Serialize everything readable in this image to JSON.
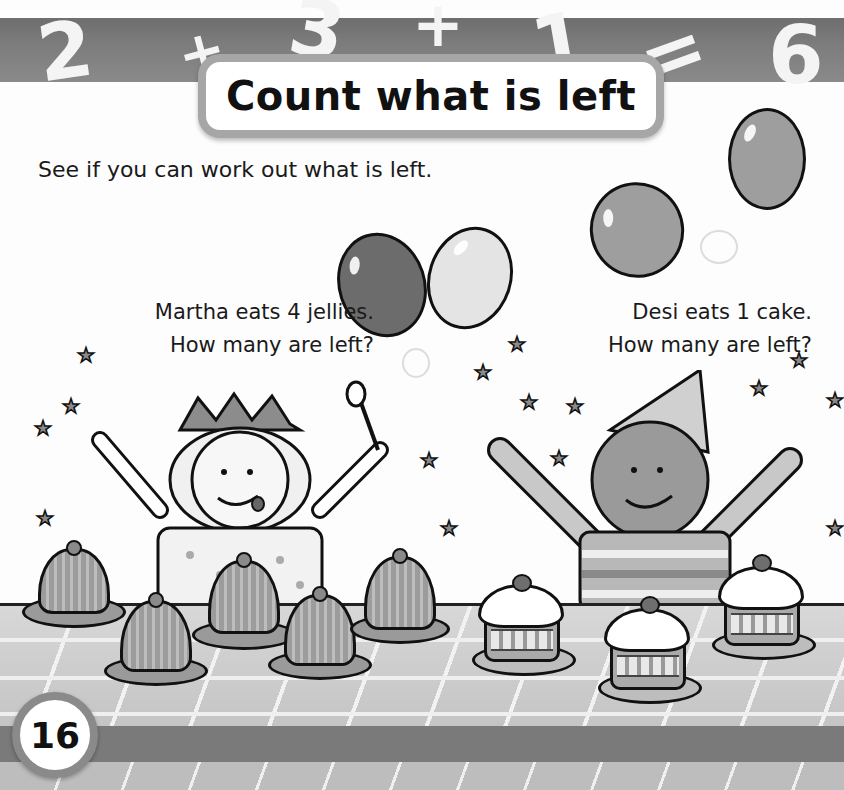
{
  "header": {
    "equation": [
      "2",
      "+",
      "3",
      "+",
      "1",
      "=",
      "6"
    ],
    "title": "Count what is left"
  },
  "intro": "See if you can work out what is left.",
  "scenes": [
    {
      "character": "Martha",
      "line1": "Martha eats 4 jellies.",
      "line2": "How many are left?",
      "food": "jelly",
      "food_count": 6
    },
    {
      "character": "Desi",
      "line1": "Desi eats 1 cake.",
      "line2": "How many are left?",
      "food": "cupcake",
      "food_count": 3
    }
  ],
  "balloons": 4,
  "page_number": "16",
  "colors": {
    "band": "#7a7a7a",
    "title_border": "#a6a6a6",
    "text": "#1a1a1a"
  }
}
